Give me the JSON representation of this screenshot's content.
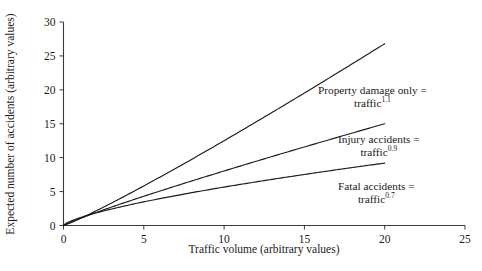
{
  "chart_data": {
    "type": "line",
    "title": "",
    "xlabel": "Traffic volume (arbitrary values)",
    "ylabel": "Expected number of accidents (arbitrary values)",
    "xlim": [
      0,
      25
    ],
    "ylim": [
      0,
      30
    ],
    "xticks": [
      0,
      5,
      10,
      15,
      20,
      25
    ],
    "yticks": [
      0,
      5,
      10,
      15,
      20,
      25,
      30
    ],
    "grid": false,
    "legend_position": "inline-annotations",
    "series": [
      {
        "name": "Property damage only",
        "exponent": 1.1,
        "formula": "traffic^1.1",
        "x": [
          0,
          2,
          4,
          6,
          8,
          10,
          12,
          14,
          16,
          18,
          20
        ],
        "values": [
          0,
          2.4,
          5.2,
          8.1,
          11.2,
          14.3,
          17.5,
          20.8,
          24.1,
          27.5,
          26.8
        ]
      },
      {
        "name": "Injury accidents",
        "exponent": 0.9,
        "formula": "traffic^0.9",
        "x": [
          0,
          2,
          4,
          6,
          8,
          10,
          12,
          14,
          16,
          18,
          20
        ],
        "values": [
          0,
          1.6,
          3.1,
          4.5,
          5.9,
          7.3,
          8.7,
          10.0,
          11.4,
          12.7,
          15.0
        ]
      },
      {
        "name": "Fatal accidents",
        "exponent": 0.7,
        "formula": "traffic^0.7",
        "x": [
          0,
          2,
          4,
          6,
          8,
          10,
          12,
          14,
          16,
          18,
          20
        ],
        "values": [
          0,
          1.1,
          2.0,
          2.8,
          3.6,
          4.4,
          5.1,
          5.8,
          6.5,
          7.1,
          9.2
        ]
      }
    ],
    "endpoints": {
      "property_damage_only": {
        "x": 20,
        "y": 26.8
      },
      "injury_accidents": {
        "x": 20,
        "y": 15.0
      },
      "fatal_accidents": {
        "x": 20,
        "y": 9.2
      }
    },
    "annotations": [
      {
        "id": "property",
        "line1": "Property damage only =",
        "base": "traffic",
        "exponent": "1.1"
      },
      {
        "id": "injury",
        "line1": "Injury accidents =",
        "base": "traffic",
        "exponent": "0.9"
      },
      {
        "id": "fatal",
        "line1": "Fatal accidents =",
        "base": "traffic",
        "exponent": "0.7"
      }
    ],
    "colors": {
      "line": "#1c1c1c",
      "axis": "#3a3a3a",
      "text": "#1a1a1a",
      "background": "#ffffff"
    }
  },
  "axis": {
    "x_ticklabels": [
      "0",
      "5",
      "10",
      "15",
      "20",
      "25"
    ],
    "y_ticklabels": [
      "0",
      "5",
      "10",
      "15",
      "20",
      "25",
      "30"
    ],
    "x_title": "Traffic volume (arbitrary values)",
    "y_title": "Expected number of accidents (arbitrary values)"
  }
}
